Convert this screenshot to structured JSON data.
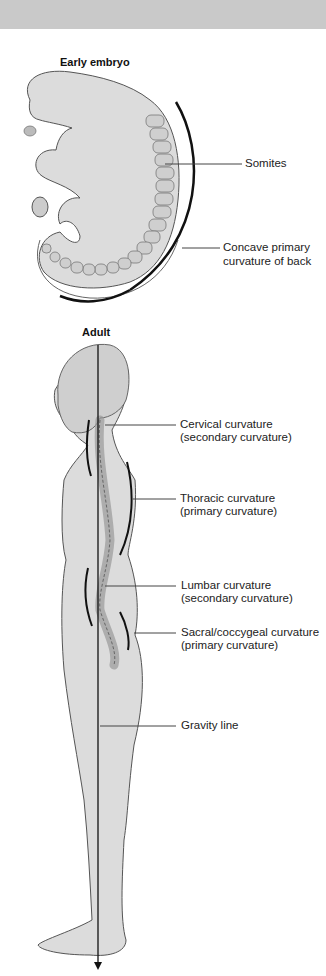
{
  "embryo": {
    "title": "Early embryo",
    "labels": {
      "somites": "Somites",
      "concave_line1": "Concave primary",
      "concave_line2": "curvature of back"
    }
  },
  "adult": {
    "title": "Adult",
    "labels": {
      "cervical_line1": "Cervical curvature",
      "cervical_line2": "(secondary curvature)",
      "thoracic_line1": "Thoracic curvature",
      "thoracic_line2": "(primary curvature)",
      "lumbar_line1": "Lumbar curvature",
      "lumbar_line2": "(secondary curvature)",
      "sacral_line1": "Sacral/coccygeal curvature",
      "sacral_line2": "(primary curvature)",
      "gravity": "Gravity line"
    }
  },
  "colors": {
    "band": "#c9c9c9",
    "body_fill": "#dcdcdc",
    "outline": "#555555",
    "curve": "#111111"
  }
}
